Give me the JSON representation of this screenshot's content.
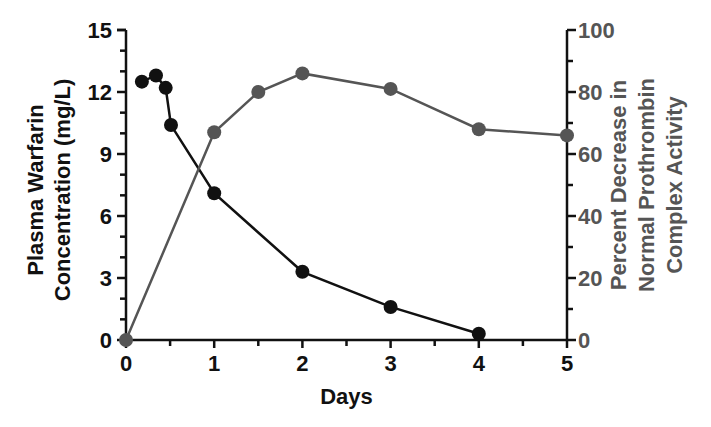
{
  "chart_data": {
    "type": "line",
    "title": "",
    "xlabel": "Days",
    "ylabel": "Plasma Warfarin Concentration (mg/L)",
    "ylabel_lines": [
      "Plasma Warfarin",
      "Concentration (mg/L)"
    ],
    "y2label": "Percent Decrease in Normal Prothrombin Complex Activity",
    "y2label_lines": [
      "Percent Decrease in",
      "Normal Prothrombin",
      "Complex Activity"
    ],
    "xlim": [
      0,
      5
    ],
    "ylim": [
      0,
      15
    ],
    "y2lim": [
      0,
      100
    ],
    "x_ticks": [
      "0",
      "1",
      "2",
      "3",
      "4",
      "5"
    ],
    "y_ticks": [
      "0",
      "3",
      "6",
      "9",
      "12",
      "15"
    ],
    "y2_ticks": [
      "0",
      "20",
      "40",
      "60",
      "80",
      "100"
    ],
    "grid": false,
    "legend": "none",
    "series": [
      {
        "name": "Plasma Warfarin Concentration (mg/L)",
        "axis": "left",
        "color": "#111111",
        "marker": "circle",
        "x": [
          0.18,
          0.34,
          0.45,
          0.51,
          1.0,
          2.0,
          3.0,
          4.0
        ],
        "values": [
          12.5,
          12.8,
          12.2,
          10.4,
          7.1,
          3.3,
          1.6,
          0.3
        ]
      },
      {
        "name": "Percent Decrease in Normal Prothrombin Complex Activity",
        "axis": "right",
        "color": "#555555",
        "marker": "circle",
        "x": [
          0,
          1.0,
          1.5,
          2.0,
          3.0,
          4.0,
          5.0
        ],
        "values": [
          0,
          67,
          80,
          86,
          81,
          68,
          66
        ]
      }
    ]
  }
}
